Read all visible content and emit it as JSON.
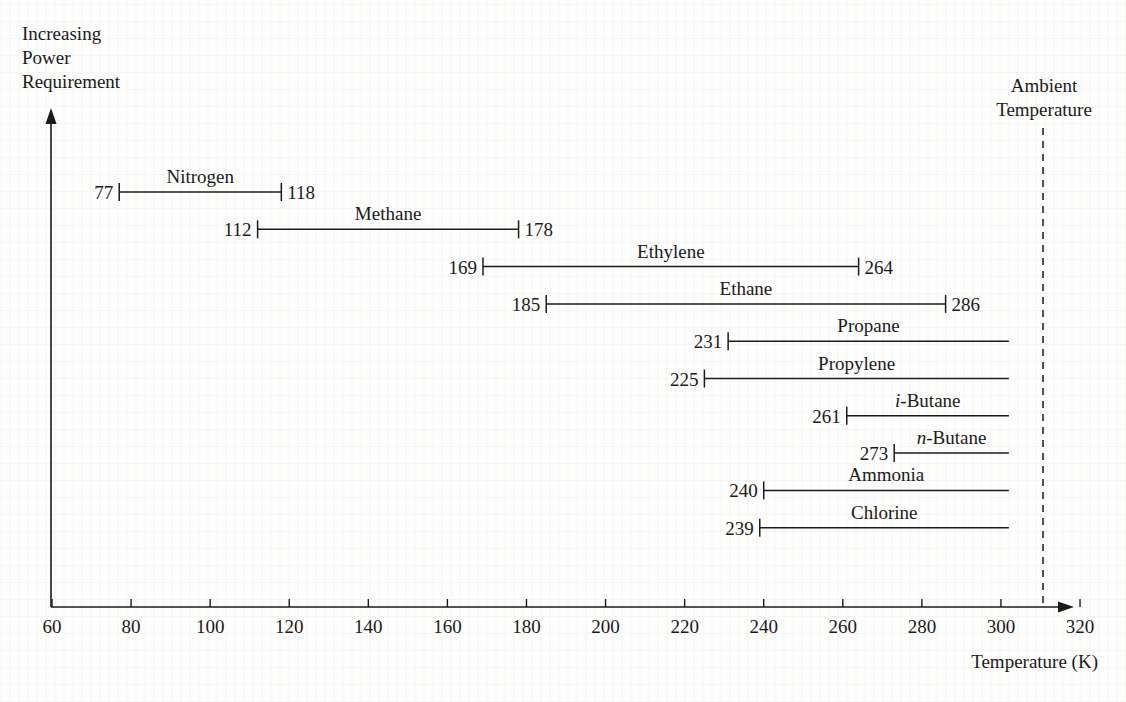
{
  "figure": {
    "y_axis_label_lines": [
      "Increasing",
      "Power",
      "Requirement"
    ],
    "x_axis_title": "Temperature (K)",
    "ambient_label_lines": [
      "Ambient",
      "Temperature"
    ],
    "ambient_temperature_k": 302
  },
  "chart_data": {
    "type": "bar",
    "title": "",
    "subtitle": "",
    "xlabel": "Temperature (K)",
    "ylabel": "Increasing Power Requirement",
    "xlim": [
      60,
      320
    ],
    "ylim": null,
    "grid": false,
    "legend": null,
    "orientation": "horizontal",
    "note": "Horizontal range bars: each refrigerant spans from its normal boiling point (left, labeled) to its critical temperature (right, labeled) or to the ambient temperature line if the critical temperature exceeds ambient.",
    "x_ticks": [
      60,
      80,
      100,
      120,
      140,
      160,
      180,
      200,
      220,
      240,
      260,
      280,
      300,
      320
    ],
    "x_tick_labels": [
      "60",
      "80",
      "100",
      "120",
      "140",
      "160",
      "180",
      "200",
      "220",
      "240",
      "260",
      "280",
      "300",
      "320"
    ],
    "annotations": [
      {
        "name": "ambient-temperature-line",
        "text": "Ambient Temperature",
        "x": 302,
        "style": "dashed-vertical"
      }
    ],
    "categories": [
      "Nitrogen",
      "Methane",
      "Ethylene",
      "Ethane",
      "Propane",
      "Propylene",
      "i-Butane",
      "n-Butane",
      "Ammonia",
      "Chlorine"
    ],
    "series": [
      {
        "name": "start",
        "values": [
          77,
          112,
          169,
          185,
          231,
          225,
          261,
          273,
          240,
          239
        ]
      },
      {
        "name": "end",
        "values": [
          118,
          178,
          264,
          286,
          302,
          302,
          302,
          302,
          302,
          302
        ]
      }
    ],
    "bars": [
      {
        "label": "Nitrogen",
        "label_prefix": "",
        "label_prefix_italic": false,
        "start": 77,
        "end": 118,
        "start_text": "77",
        "end_text": "118",
        "end_capped": true,
        "row": 1
      },
      {
        "label": "Methane",
        "label_prefix": "",
        "label_prefix_italic": false,
        "start": 112,
        "end": 178,
        "start_text": "112",
        "end_text": "178",
        "end_capped": true,
        "row": 2
      },
      {
        "label": "Ethylene",
        "label_prefix": "",
        "label_prefix_italic": false,
        "start": 169,
        "end": 264,
        "start_text": "169",
        "end_text": "264",
        "end_capped": true,
        "row": 3
      },
      {
        "label": "Ethane",
        "label_prefix": "",
        "label_prefix_italic": false,
        "start": 185,
        "end": 286,
        "start_text": "185",
        "end_text": "286",
        "end_capped": true,
        "row": 4
      },
      {
        "label": "Propane",
        "label_prefix": "",
        "label_prefix_italic": false,
        "start": 231,
        "end": 302,
        "start_text": "231",
        "end_text": "",
        "end_capped": false,
        "row": 5
      },
      {
        "label": "Propylene",
        "label_prefix": "",
        "label_prefix_italic": false,
        "start": 225,
        "end": 302,
        "start_text": "225",
        "end_text": "",
        "end_capped": false,
        "row": 6
      },
      {
        "label": "Butane",
        "label_prefix": "i-",
        "label_prefix_italic": true,
        "start": 261,
        "end": 302,
        "start_text": "261",
        "end_text": "",
        "end_capped": false,
        "row": 7
      },
      {
        "label": "Butane",
        "label_prefix": "n-",
        "label_prefix_italic": true,
        "start": 273,
        "end": 302,
        "start_text": "273",
        "end_text": "",
        "end_capped": false,
        "row": 8
      },
      {
        "label": "Ammonia",
        "label_prefix": "",
        "label_prefix_italic": false,
        "start": 240,
        "end": 302,
        "start_text": "240",
        "end_text": "",
        "end_capped": false,
        "row": 9
      },
      {
        "label": "Chlorine",
        "label_prefix": "",
        "label_prefix_italic": false,
        "start": 239,
        "end": 302,
        "start_text": "239",
        "end_text": "",
        "end_capped": false,
        "row": 10
      }
    ]
  }
}
